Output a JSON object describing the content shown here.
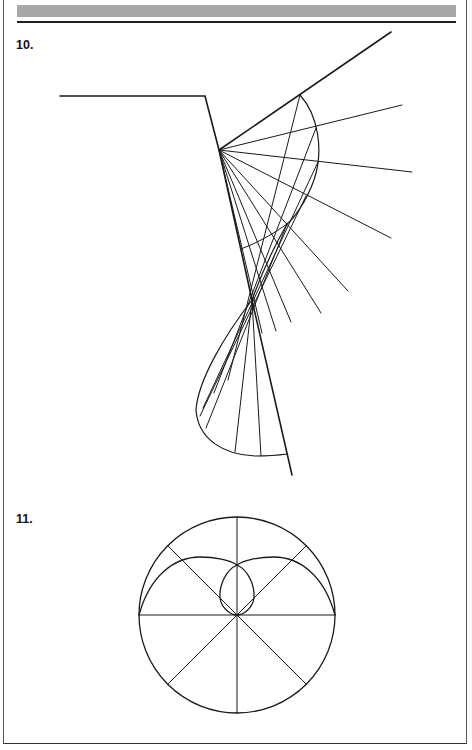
{
  "page": {
    "header_band": "gray-banner",
    "figures": [
      {
        "label": "10.",
        "description": "Reflection caustic construction: a bent boundary line with a fan of rays from a pivot point, a lens-shaped curve, rays converging to a crossing point and a lower curved lobe",
        "ray_count_upper_fan": 9,
        "ray_count_lower_fan": 6
      },
      {
        "label": "11.",
        "description": "Circle divided by 8 radial lines with a curve forming two outer arches and an inner loop through the center",
        "radial_divisions": 8
      }
    ]
  },
  "colors": {
    "ink": "#1a1a1a",
    "banner": "#a8a8a8",
    "background": "#ffffff"
  }
}
